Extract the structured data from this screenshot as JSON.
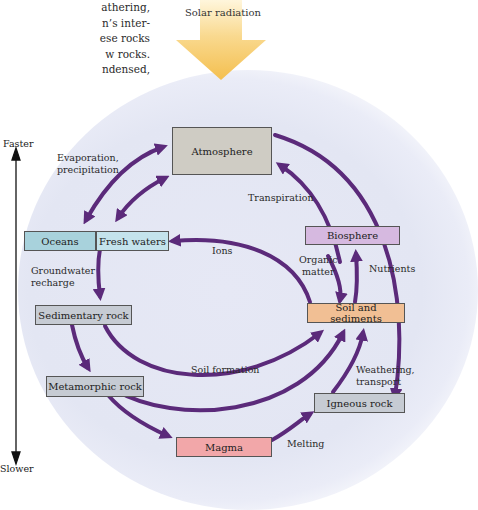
{
  "intro_text": [
    "athering,",
    "n’s inter-",
    "ese rocks",
    "w rocks.",
    "ndensed,"
  ],
  "solar": {
    "label": "Solar radiation",
    "color": "#f5c35a"
  },
  "axis": {
    "top_label": "Faster",
    "bottom_label": "Slower"
  },
  "colors": {
    "arrow": "#5b2a7a",
    "atmosphere": "#cfccc4",
    "water": "#a8d2dc",
    "fresh_water": "#c4e3ec",
    "rock": "#c6cbd3",
    "biosphere": "#d6b9e0",
    "soil": "#f1bf94",
    "magma": "#f2a7a9"
  },
  "boxes": {
    "atmosphere": "Atmosphere",
    "oceans": "Oceans",
    "fresh_waters": "Fresh waters",
    "biosphere": "Biosphere",
    "sedimentary_rock": "Sedimentary rock",
    "soil_and_sediments": "Soil and sediments",
    "metamorphic_rock": "Metamorphic rock",
    "igneous_rock": "Igneous rock",
    "magma": "Magma"
  },
  "labels": {
    "evaporation": [
      "Evaporation,",
      "precipitation"
    ],
    "transpiration": "Transpiration",
    "ions": "Ions",
    "organic_matter": [
      "Organic",
      "matter"
    ],
    "nutrients": "Nutrients",
    "groundwater": [
      "Groundwater",
      "recharge"
    ],
    "soil_formation": "Soil formation",
    "weathering": [
      "Weathering,",
      "transport"
    ],
    "melting": "Melting"
  }
}
